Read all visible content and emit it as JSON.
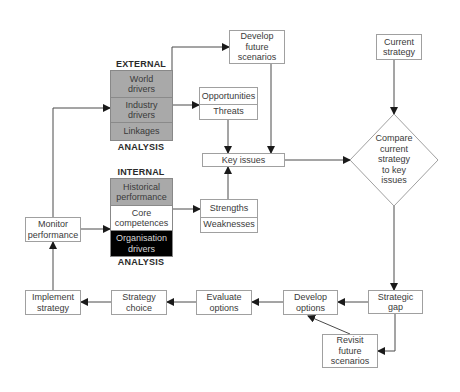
{
  "diagram": {
    "external_group": {
      "header": "EXTERNAL",
      "footer": "ANALYSIS",
      "rows": [
        {
          "label": "World\ndrivers",
          "fill": "grey"
        },
        {
          "label": "Industry\ndrivers",
          "fill": "grey"
        },
        {
          "label": "Linkages",
          "fill": "grey"
        }
      ]
    },
    "internal_group": {
      "header": "INTERNAL",
      "footer": "ANALYSIS",
      "rows": [
        {
          "label": "Historical\nperformance",
          "fill": "grey"
        },
        {
          "label": "Core\ncompetences",
          "fill": "white"
        },
        {
          "label": "Organisation\ndrivers",
          "fill": "black"
        }
      ]
    },
    "nodes": {
      "develop_future_scenarios": "Develop\nfuture\nscenarios",
      "opportunities": "Opportunities",
      "threats": "Threats",
      "key_issues": "Key issues",
      "strengths": "Strengths",
      "weaknesses": "Weaknesses",
      "current_strategy": "Current\nstrategy",
      "compare_decision": "Compare\ncurrent\nstrategy\nto key\nissues",
      "strategic_gap": "Strategic\ngap",
      "develop_options": "Develop\noptions",
      "evaluate_options": "Evaluate\noptions",
      "strategy_choice": "Strategy\nchoice",
      "implement_strategy": "Implement\nstrategy",
      "monitor_performance": "Monitor\nperformance",
      "revisit_future_scenarios": "Revisit\nfuture\nscenarios"
    },
    "edges": [
      {
        "from": "External analysis",
        "to": "Develop future scenarios"
      },
      {
        "from": "Industry drivers",
        "to": "Opportunities/Threats"
      },
      {
        "from": "Opportunities/Threats",
        "to": "Key issues"
      },
      {
        "from": "Develop future scenarios",
        "to": "Key issues"
      },
      {
        "from": "Strengths/Weaknesses",
        "to": "Key issues"
      },
      {
        "from": "Core competences",
        "to": "Strengths/Weaknesses"
      },
      {
        "from": "Key issues",
        "to": "Compare current strategy to key issues"
      },
      {
        "from": "Current strategy",
        "to": "Compare current strategy to key issues"
      },
      {
        "from": "Compare current strategy to key issues",
        "to": "Strategic gap"
      },
      {
        "from": "Strategic gap",
        "to": "Develop options"
      },
      {
        "from": "Strategic gap",
        "to": "Revisit future scenarios"
      },
      {
        "from": "Revisit future scenarios",
        "to": "Develop options"
      },
      {
        "from": "Develop options",
        "to": "Evaluate options"
      },
      {
        "from": "Evaluate options",
        "to": "Strategy choice"
      },
      {
        "from": "Strategy choice",
        "to": "Implement strategy"
      },
      {
        "from": "Implement strategy",
        "to": "Monitor performance"
      },
      {
        "from": "Monitor performance",
        "to": "Core competences"
      },
      {
        "from": "Monitor performance",
        "to": "Industry drivers"
      }
    ],
    "colors": {
      "grey_fill": "#a9a9a9",
      "black_fill": "#000000",
      "line": "#3a3a3a",
      "border": "#a0a0a0"
    }
  }
}
